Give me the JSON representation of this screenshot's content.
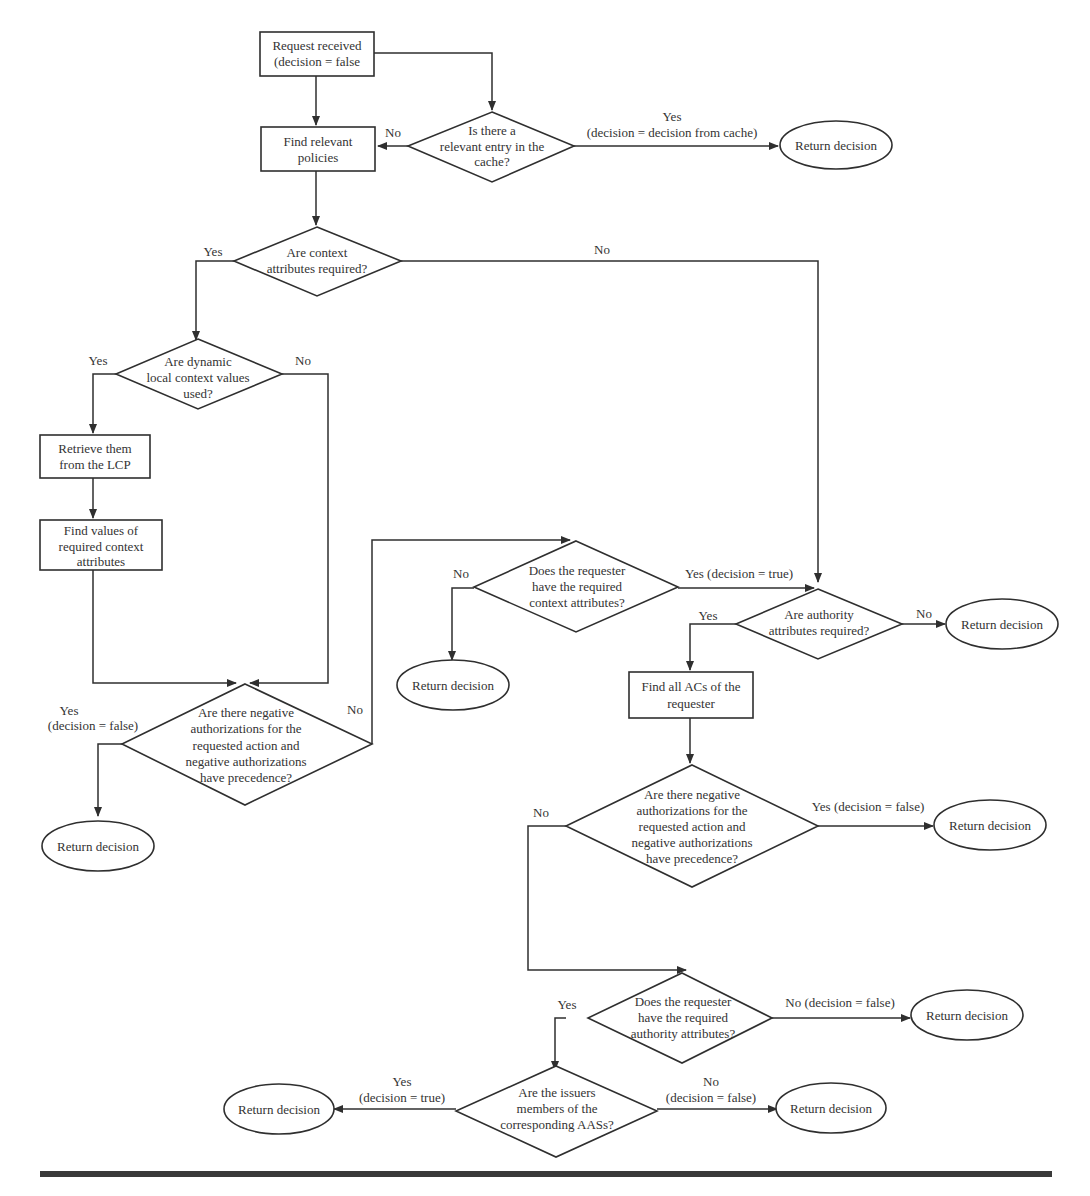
{
  "diagram": {
    "type": "flowchart",
    "colors": {
      "stroke": "#2f2f2f",
      "text": "#333333",
      "background": "#ffffff"
    },
    "nodes": {
      "start": {
        "lines": [
          "Request received",
          "(decision = false"
        ]
      },
      "cache_check": {
        "lines": [
          "Is there a",
          "relevant entry in the",
          "cache?"
        ]
      },
      "return_cache": {
        "lines": [
          "Return decision"
        ]
      },
      "find_policies": {
        "lines": [
          "Find relevant",
          "policies"
        ]
      },
      "context_required": {
        "lines": [
          "Are context",
          "attributes required?"
        ]
      },
      "dynamic_used": {
        "lines": [
          "Are dynamic",
          "local context values",
          "used?"
        ]
      },
      "retrieve_lcp": {
        "lines": [
          "Retrieve them",
          "from the LCP"
        ]
      },
      "find_values": {
        "lines": [
          "Find values of",
          "required context",
          "attributes"
        ]
      },
      "neg_auth_1": {
        "lines": [
          "Are there negative",
          "authorizations for the",
          "requested action and",
          "negative authorizations",
          "have precedence?"
        ]
      },
      "return_neg1": {
        "lines": [
          "Return decision"
        ]
      },
      "has_context": {
        "lines": [
          "Does the requester",
          "have the required",
          "context attributes?"
        ]
      },
      "return_no_context": {
        "lines": [
          "Return decision"
        ]
      },
      "authority_required": {
        "lines": [
          "Are authority",
          "attributes required?"
        ]
      },
      "return_no_authority": {
        "lines": [
          "Return decision"
        ]
      },
      "find_acs": {
        "lines": [
          "Find all ACs of the",
          "requester"
        ]
      },
      "neg_auth_2": {
        "lines": [
          "Are there negative",
          "authorizations for the",
          "requested action and",
          "negative authorizations",
          "have precedence?"
        ]
      },
      "return_neg2": {
        "lines": [
          "Return decision"
        ]
      },
      "has_authority": {
        "lines": [
          "Does the requester",
          "have the required",
          "authority attributes?"
        ]
      },
      "return_no_auth_attr": {
        "lines": [
          "Return decision"
        ]
      },
      "issuers_members": {
        "lines": [
          "Are the issuers",
          "members of the",
          "corresponding AASs?"
        ]
      },
      "return_true": {
        "lines": [
          "Return decision"
        ]
      },
      "return_false": {
        "lines": [
          "Return decision"
        ]
      }
    },
    "edge_labels": {
      "cache_no": "No",
      "cache_yes_1": "Yes",
      "cache_yes_2": "(decision = decision from cache)",
      "context_yes": "Yes",
      "context_no": "No",
      "dynamic_yes": "Yes",
      "dynamic_no": "No",
      "neg1_yes_1": "Yes",
      "neg1_yes_2": "(decision = false)",
      "neg1_no": "No",
      "has_context_no": "No",
      "has_context_yes": "Yes (decision = true)",
      "authority_yes": "Yes",
      "authority_no": "No",
      "neg2_no": "No",
      "neg2_yes": "Yes (decision = false)",
      "has_authority_yes": "Yes",
      "has_authority_no": "No (decision = false)",
      "issuers_yes_1": "Yes",
      "issuers_yes_2": "(decision = true)",
      "issuers_no_1": "No",
      "issuers_no_2": "(decision = false)"
    }
  }
}
